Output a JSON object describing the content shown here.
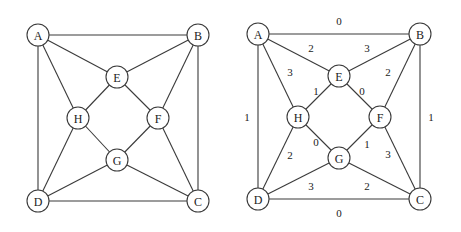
{
  "graphs": [
    {
      "id": "unweighted",
      "nodes": [
        {
          "label": "A",
          "x": 38,
          "y": 35
        },
        {
          "label": "B",
          "x": 198,
          "y": 35
        },
        {
          "label": "E",
          "x": 117,
          "y": 77
        },
        {
          "label": "H",
          "x": 78,
          "y": 118
        },
        {
          "label": "F",
          "x": 158,
          "y": 118
        },
        {
          "label": "G",
          "x": 117,
          "y": 160
        },
        {
          "label": "D",
          "x": 38,
          "y": 201
        },
        {
          "label": "C",
          "x": 198,
          "y": 201
        }
      ],
      "edges": [
        {
          "from": "A",
          "to": "B"
        },
        {
          "from": "A",
          "to": "E"
        },
        {
          "from": "A",
          "to": "H"
        },
        {
          "from": "A",
          "to": "D"
        },
        {
          "from": "B",
          "to": "E"
        },
        {
          "from": "B",
          "to": "F"
        },
        {
          "from": "B",
          "to": "C"
        },
        {
          "from": "E",
          "to": "H"
        },
        {
          "from": "E",
          "to": "F"
        },
        {
          "from": "H",
          "to": "G"
        },
        {
          "from": "H",
          "to": "D"
        },
        {
          "from": "F",
          "to": "G"
        },
        {
          "from": "F",
          "to": "C"
        },
        {
          "from": "G",
          "to": "D"
        },
        {
          "from": "G",
          "to": "C"
        },
        {
          "from": "D",
          "to": "C"
        }
      ]
    },
    {
      "id": "weighted",
      "nodes": [
        {
          "label": "A",
          "x": 258,
          "y": 34
        },
        {
          "label": "B",
          "x": 420,
          "y": 34
        },
        {
          "label": "E",
          "x": 339,
          "y": 76
        },
        {
          "label": "H",
          "x": 298,
          "y": 117
        },
        {
          "label": "F",
          "x": 380,
          "y": 117
        },
        {
          "label": "G",
          "x": 339,
          "y": 158
        },
        {
          "label": "D",
          "x": 258,
          "y": 199
        },
        {
          "label": "C",
          "x": 420,
          "y": 199
        }
      ],
      "edges": [
        {
          "from": "A",
          "to": "B",
          "weight": "0",
          "lx": 339,
          "ly": 21
        },
        {
          "from": "A",
          "to": "E",
          "weight": "2",
          "lx": 311,
          "ly": 48
        },
        {
          "from": "A",
          "to": "H",
          "weight": "3",
          "lx": 290,
          "ly": 72
        },
        {
          "from": "A",
          "to": "D",
          "weight": "1",
          "lx": 247,
          "ly": 117
        },
        {
          "from": "B",
          "to": "E",
          "weight": "3",
          "lx": 367,
          "ly": 48
        },
        {
          "from": "B",
          "to": "F",
          "weight": "2",
          "lx": 388,
          "ly": 72
        },
        {
          "from": "B",
          "to": "C",
          "weight": "1",
          "lx": 431,
          "ly": 117
        },
        {
          "from": "E",
          "to": "H",
          "weight": "1",
          "lx": 316,
          "ly": 91
        },
        {
          "from": "E",
          "to": "F",
          "weight": "0",
          "lx": 362,
          "ly": 91
        },
        {
          "from": "H",
          "to": "G",
          "weight": "0",
          "lx": 316,
          "ly": 142
        },
        {
          "from": "H",
          "to": "D",
          "weight": "2",
          "lx": 290,
          "ly": 155
        },
        {
          "from": "F",
          "to": "G",
          "weight": "1",
          "lx": 367,
          "ly": 144
        },
        {
          "from": "F",
          "to": "C",
          "weight": "3",
          "lx": 388,
          "ly": 154
        },
        {
          "from": "G",
          "to": "D",
          "weight": "3",
          "lx": 311,
          "ly": 186
        },
        {
          "from": "G",
          "to": "C",
          "weight": "2",
          "lx": 367,
          "ly": 186
        },
        {
          "from": "D",
          "to": "C",
          "weight": "0",
          "lx": 339,
          "ly": 213
        }
      ]
    }
  ],
  "node_radius": 11
}
